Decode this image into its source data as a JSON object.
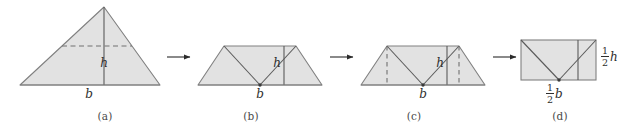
{
  "figure": {
    "type": "geometric-dissection-diagram",
    "background_color": "#ffffff",
    "fill_color": "#e2e2e2",
    "stroke_color": "#808080",
    "cut_line_color": "#6b6b6b",
    "dash_color": "#707070",
    "text_color": "#2e2e2e",
    "caption_color": "#4a4a4a",
    "panels": [
      {
        "id": "a",
        "caption": "(a)",
        "shape": "triangle",
        "labels": {
          "base": "b",
          "height": "h"
        }
      },
      {
        "id": "b",
        "caption": "(b)",
        "shape": "trapezoid",
        "labels": {
          "base": "b",
          "height": "h"
        }
      },
      {
        "id": "c",
        "caption": "(c)",
        "shape": "trapezoid-with-cuts",
        "labels": {
          "base": "b",
          "height": "h"
        }
      },
      {
        "id": "d",
        "caption": "(d)",
        "shape": "rectangle",
        "labels": {
          "base_numerator": "1",
          "base_denominator": "2",
          "base_variable": "b",
          "height_numerator": "1",
          "height_denominator": "2",
          "height_variable": "h"
        }
      }
    ],
    "arrows": [
      {
        "id": "arrow-1",
        "from": "a",
        "to": "b"
      },
      {
        "id": "arrow-2",
        "from": "b",
        "to": "c"
      },
      {
        "id": "arrow-3",
        "from": "c",
        "to": "d"
      }
    ]
  }
}
